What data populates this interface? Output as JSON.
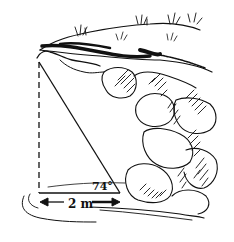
{
  "diagram": {
    "type": "right-triangle-on-cliff",
    "angle_label": "74°",
    "distance_label": "2 m",
    "colors": {
      "ink": "#111111",
      "background": "#ffffff"
    },
    "elements": [
      "cliff with grass and boulders",
      "dashed vertical height line",
      "hypotenuse sight line",
      "horizontal base line",
      "double-headed distance arrow"
    ]
  }
}
